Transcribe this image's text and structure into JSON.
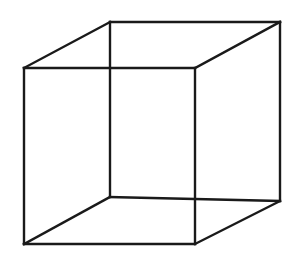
{
  "figure": {
    "name": "Necker cube",
    "kind": "line-drawing",
    "canvas": {
      "width": 300,
      "height": 274,
      "background_color": "#ffffff"
    },
    "style": {
      "stroke_color": "#1a1a1a",
      "stroke_width": 2.4,
      "fill": "none",
      "line_cap": "square",
      "line_join": "miter"
    },
    "projection": {
      "type": "parallel",
      "depth_offset_x": 85,
      "depth_offset_y": -45
    },
    "vertices": {
      "front_top_left": {
        "label": "A",
        "x": 24,
        "y": 68
      },
      "front_top_right": {
        "label": "B",
        "x": 195,
        "y": 68
      },
      "front_bottom_right": {
        "label": "C",
        "x": 195,
        "y": 244
      },
      "front_bottom_left": {
        "label": "D",
        "x": 24,
        "y": 244
      },
      "back_top_left": {
        "label": "E",
        "x": 110,
        "y": 22
      },
      "back_top_right": {
        "label": "F",
        "x": 280,
        "y": 22
      },
      "back_bottom_right": {
        "label": "G",
        "x": 280,
        "y": 201
      },
      "back_bottom_left": {
        "label": "H",
        "x": 110,
        "y": 197
      }
    },
    "faces": {
      "front_square_points": "24,68 195,68 195,244 24,244",
      "back_square_points": "110,22 280,22 280,201 110,197"
    },
    "edges": [
      {
        "name": "front-top",
        "from": "front_top_left",
        "to": "front_top_right",
        "d": "M 24 68 L 195 68"
      },
      {
        "name": "front-right",
        "from": "front_top_right",
        "to": "front_bottom_right",
        "d": "M 195 68 L 195 244"
      },
      {
        "name": "front-bottom",
        "from": "front_bottom_right",
        "to": "front_bottom_left",
        "d": "M 195 244 L 24 244"
      },
      {
        "name": "front-left",
        "from": "front_bottom_left",
        "to": "front_top_left",
        "d": "M 24 244 L 24 68"
      },
      {
        "name": "back-top",
        "from": "back_top_left",
        "to": "back_top_right",
        "d": "M 110 22 L 280 22"
      },
      {
        "name": "back-right",
        "from": "back_top_right",
        "to": "back_bottom_right",
        "d": "M 280 22 L 280 201"
      },
      {
        "name": "back-bottom",
        "from": "back_bottom_right",
        "to": "back_bottom_left",
        "d": "M 280 201 L 110 197"
      },
      {
        "name": "back-left",
        "from": "back_bottom_left",
        "to": "back_top_left",
        "d": "M 110 197 L 110 22"
      },
      {
        "name": "connector-top-left",
        "from": "front_top_left",
        "to": "back_top_left",
        "d": "M 24 68 L 110 22"
      },
      {
        "name": "connector-top-right",
        "from": "front_top_right",
        "to": "back_top_right",
        "d": "M 195 68 L 280 22"
      },
      {
        "name": "connector-bottom-right",
        "from": "front_bottom_right",
        "to": "back_bottom_right",
        "d": "M 195 244 L 280 201"
      },
      {
        "name": "connector-bottom-left",
        "from": "front_bottom_left",
        "to": "back_bottom_left",
        "d": "M 24 244 L 110 197"
      }
    ]
  }
}
